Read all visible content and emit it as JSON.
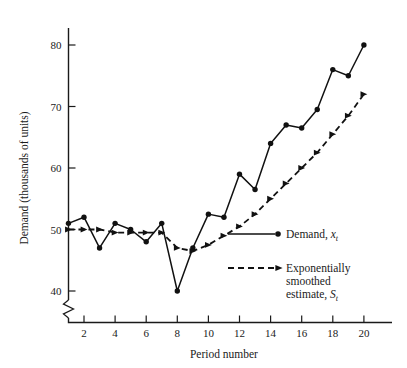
{
  "chart_data": {
    "type": "line",
    "title": "",
    "xlabel": "Period number",
    "ylabel": "Demand (thousands of units)",
    "x": [
      1,
      2,
      3,
      4,
      5,
      6,
      7,
      8,
      9,
      10,
      11,
      12,
      13,
      14,
      15,
      16,
      17,
      18,
      19,
      20
    ],
    "xlim": [
      1,
      20
    ],
    "ylim": [
      38,
      82
    ],
    "grid": false,
    "legend_position": "middle-right",
    "y_axis_break": true,
    "series": [
      {
        "name": "Demand, x",
        "label": "Demand,",
        "symbol": "x",
        "subscript": "t",
        "style": "solid",
        "marker": "circle",
        "values": [
          51,
          52,
          47,
          51,
          50,
          48,
          51,
          40,
          47,
          52.5,
          52,
          59,
          56.5,
          64,
          67,
          66.5,
          69.5,
          76,
          75,
          80
        ]
      },
      {
        "name": "Exponentially smoothed estimate, S",
        "label_lines": [
          "Exponentially",
          "smoothed",
          "estimate,"
        ],
        "symbol": "S",
        "subscript": "t",
        "style": "dashed",
        "marker": "triangle",
        "values": [
          50,
          50,
          50,
          49.5,
          49.5,
          49.5,
          49.5,
          47,
          46.5,
          47.5,
          49,
          50.5,
          52.5,
          55,
          57.5,
          60,
          62.5,
          65.5,
          68.5,
          72
        ]
      }
    ],
    "x_ticks": [
      2,
      4,
      6,
      8,
      10,
      12,
      14,
      16,
      18,
      20
    ],
    "y_ticks": [
      40,
      50,
      60,
      70,
      80
    ],
    "colors": {
      "axis": "#1a1a1a",
      "demand": "#111111",
      "smoothed": "#111111",
      "background": "#ffffff"
    }
  },
  "legend": {
    "demand": {
      "text": "Demand,",
      "symbol": "x",
      "subscript": "t"
    },
    "smoothed": {
      "line1": "Exponentially",
      "line2": "smoothed",
      "line3": "estimate,",
      "symbol": "S",
      "subscript": "t"
    }
  }
}
